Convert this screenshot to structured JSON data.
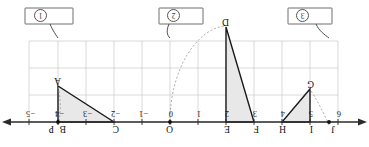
{
  "figure": {
    "type": "geometry-number-line-transformations",
    "orientation": "rotated-180",
    "background": "#ffffff",
    "grid_color": "#c9c9c9",
    "axis_color": "#2b2b2b",
    "shape_stroke": "#1a1a1a",
    "shape_fill": "#e6e6e6",
    "dashed_color": "#9a9a9a"
  },
  "axis": {
    "name": "horizontal-number-line",
    "ticks": [
      {
        "label": "6",
        "value": 6
      },
      {
        "label": "5",
        "value": 5
      },
      {
        "label": "4",
        "value": 4
      },
      {
        "label": "3",
        "value": 3
      },
      {
        "label": "2",
        "value": 2
      },
      {
        "label": "1",
        "value": 1
      },
      {
        "label": "0",
        "value": 0
      },
      {
        "label": "−1",
        "value": -1
      },
      {
        "label": "−2",
        "value": -2
      },
      {
        "label": "−3",
        "value": -3
      },
      {
        "label": "−4",
        "value": -4
      },
      {
        "label": "−5",
        "value": -5
      }
    ],
    "left_arrow": true,
    "right_arrow": true
  },
  "points": [
    {
      "label": "A",
      "name": "point-a"
    },
    {
      "label": "B",
      "name": "point-b"
    },
    {
      "label": "C",
      "name": "point-c"
    },
    {
      "label": "D",
      "name": "point-d"
    },
    {
      "label": "E",
      "name": "point-e"
    },
    {
      "label": "F",
      "name": "point-f"
    },
    {
      "label": "G",
      "name": "point-g"
    },
    {
      "label": "H",
      "name": "point-h"
    },
    {
      "label": "I",
      "name": "point-i"
    },
    {
      "label": "J",
      "name": "point-j"
    },
    {
      "label": "O",
      "name": "point-o"
    },
    {
      "label": "P",
      "name": "point-p"
    }
  ],
  "callouts": [
    {
      "id": "1",
      "name": "callout-one",
      "text": ""
    },
    {
      "id": "2",
      "name": "callout-two",
      "text": ""
    },
    {
      "id": "3",
      "name": "callout-three",
      "text": ""
    }
  ],
  "shapes": [
    {
      "name": "triangle-abc",
      "vertices": [
        "A",
        "B",
        "C"
      ],
      "filled": true
    },
    {
      "name": "triangle-def",
      "vertices": [
        "D",
        "E",
        "F"
      ],
      "filled": true
    },
    {
      "name": "triangle-ghj",
      "vertices": [
        "G",
        "H",
        "J"
      ],
      "filled": true
    }
  ]
}
